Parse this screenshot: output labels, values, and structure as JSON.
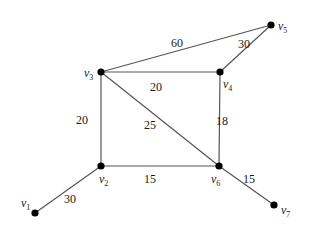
{
  "graph": {
    "nodes": [
      {
        "id": "v1",
        "label": "v",
        "sub": "1"
      },
      {
        "id": "v2",
        "label": "v",
        "sub": "2"
      },
      {
        "id": "v3",
        "label": "v",
        "sub": "3"
      },
      {
        "id": "v4",
        "label": "v",
        "sub": "4"
      },
      {
        "id": "v5",
        "label": "v",
        "sub": "5"
      },
      {
        "id": "v6",
        "label": "v",
        "sub": "6"
      },
      {
        "id": "v7",
        "label": "v",
        "sub": "7"
      }
    ],
    "edges": [
      {
        "from": "v3",
        "to": "v5",
        "weight": "60"
      },
      {
        "from": "v4",
        "to": "v5",
        "weight": "30"
      },
      {
        "from": "v3",
        "to": "v4",
        "weight": "20"
      },
      {
        "from": "v3",
        "to": "v2",
        "weight": "20"
      },
      {
        "from": "v3",
        "to": "v6",
        "weight": "25"
      },
      {
        "from": "v4",
        "to": "v6",
        "weight": "18"
      },
      {
        "from": "v2",
        "to": "v6",
        "weight": "15"
      },
      {
        "from": "v6",
        "to": "v7",
        "weight": "15"
      },
      {
        "from": "v1",
        "to": "v2",
        "weight": "30"
      }
    ]
  }
}
